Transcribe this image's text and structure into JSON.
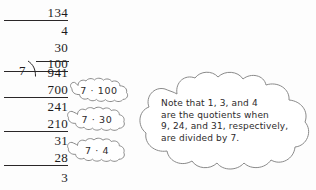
{
  "figure": {
    "type": "long-division-worked-example",
    "problem": "941 ÷ 7",
    "method": "partial quotients"
  },
  "division": {
    "divisor": "7",
    "dividend": "941",
    "partial_quotients": [
      {
        "value": "134",
        "ruled": true
      },
      {
        "value": "4",
        "ruled": false
      },
      {
        "value": "30",
        "ruled": false
      },
      {
        "value": "100",
        "ruled": true
      }
    ],
    "work_rows": [
      {
        "value": "941",
        "ruled": false
      },
      {
        "value": "700",
        "ruled": true
      },
      {
        "value": "241",
        "ruled": false
      },
      {
        "value": "210",
        "ruled": true
      },
      {
        "value": "31",
        "ruled": false
      },
      {
        "value": "28",
        "ruled": true
      },
      {
        "value": "3",
        "ruled": false
      }
    ],
    "remainder": "3",
    "quotient": "134"
  },
  "callouts": [
    {
      "id": "callout-700",
      "label": "7 · 100"
    },
    {
      "id": "callout-210",
      "label": "7 · 30"
    },
    {
      "id": "callout-28",
      "label": "7 · 4"
    }
  ],
  "note": {
    "lines": [
      "Note that 1, 3, and 4",
      "are the quotients when",
      "9, 24, and 31, respectively,",
      "are divided by 7."
    ],
    "full_text": "Note that 1, 3, and 4 are the quotients when 9, 24, and 31, respectively, are divided by 7."
  },
  "colors": {
    "ink": "#1c1a1b",
    "cloud_stroke": "#8a8a8a",
    "cloud_fill": "#ffffff",
    "background": "#fdfdfd"
  }
}
